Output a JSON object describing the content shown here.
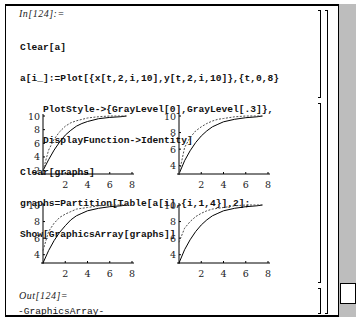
{
  "notebook": {
    "input_label": "In[124]:=",
    "input_code": [
      "Clear[a]",
      "a[i_]:=Plot[{x[t,2,i,10],y[t,2,i,10]},{t,0,8}",
      "    PlotStyle->{GrayLevel[0],GrayLevel[.3]},",
      "    DisplayFunction->Identity]",
      "Clear[graphs]",
      "graphs=Partition[Table[a[i],{i,1,4}],2];",
      "Show[GraphicsArray[graphs]]"
    ],
    "output_label": "Out[124]=",
    "output_text": "-GraphicsArray-"
  },
  "colors": {
    "background": "#ffffff",
    "text": "#111111",
    "scrollbar": "#bdbdbd",
    "solid_curve": "#000000",
    "dashed_curve": "#4d4d4d"
  },
  "chart_data": [
    {
      "type": "line",
      "title": "a[1]",
      "xlabel": "",
      "ylabel": "",
      "xticks": [
        2,
        4,
        6,
        8
      ],
      "yticks": [
        2,
        4,
        6,
        8,
        10
      ],
      "xlim": [
        0,
        8
      ],
      "ylim": [
        1.5,
        10
      ],
      "x": [
        0,
        0.5,
        1,
        1.5,
        2,
        2.5,
        3,
        3.5,
        4,
        5,
        6,
        7,
        7.5
      ],
      "series": [
        {
          "name": "x[t,2,1,10]",
          "style": "solid",
          "values": [
            2,
            3.6,
            5.0,
            6.2,
            7.2,
            7.9,
            8.5,
            8.9,
            9.2,
            9.6,
            9.8,
            9.9,
            10
          ]
        },
        {
          "name": "y[t,2,1,10]",
          "style": "dashed",
          "values": [
            2,
            5.0,
            6.6,
            7.7,
            8.5,
            9.0,
            9.3,
            9.5,
            9.7,
            9.9,
            10,
            10,
            10
          ]
        }
      ]
    },
    {
      "type": "line",
      "title": "a[2]",
      "xlabel": "",
      "ylabel": "",
      "xticks": [
        2,
        4,
        6,
        8
      ],
      "yticks": [
        4,
        6,
        8,
        10
      ],
      "xlim": [
        0,
        8
      ],
      "ylim": [
        3,
        10
      ],
      "x": [
        0,
        0.5,
        1,
        1.5,
        2,
        2.5,
        3,
        3.5,
        4,
        5,
        6,
        7,
        7.5
      ],
      "series": [
        {
          "name": "x[t,2,2,10]",
          "style": "solid",
          "values": [
            3,
            4.6,
            5.8,
            6.8,
            7.6,
            8.2,
            8.7,
            9.0,
            9.3,
            9.6,
            9.8,
            9.9,
            10
          ]
        },
        {
          "name": "y[t,2,2,10]",
          "style": "dashed",
          "values": [
            3,
            6.2,
            7.4,
            8.2,
            8.7,
            9.1,
            9.4,
            9.6,
            9.7,
            9.9,
            10,
            10,
            10
          ]
        }
      ]
    },
    {
      "type": "line",
      "title": "a[3]",
      "xlabel": "",
      "ylabel": "",
      "xticks": [
        2,
        4,
        6,
        8
      ],
      "yticks": [
        4,
        6,
        8,
        10
      ],
      "xlim": [
        0,
        8
      ],
      "ylim": [
        3,
        10
      ],
      "x": [
        0,
        0.5,
        1,
        1.5,
        2,
        2.5,
        3,
        3.5,
        4,
        5,
        6,
        7,
        7.5
      ],
      "series": [
        {
          "name": "x[t,2,3,10]",
          "style": "solid",
          "values": [
            3,
            4.5,
            5.7,
            6.7,
            7.5,
            8.2,
            8.7,
            9.0,
            9.3,
            9.6,
            9.8,
            9.9,
            10
          ]
        },
        {
          "name": "y[t,2,3,10]",
          "style": "dashed",
          "values": [
            4.5,
            6.8,
            7.8,
            8.5,
            8.9,
            9.2,
            9.5,
            9.6,
            9.7,
            9.9,
            10,
            10,
            10
          ]
        }
      ]
    },
    {
      "type": "line",
      "title": "a[4]",
      "xlabel": "",
      "ylabel": "",
      "xticks": [
        2,
        4,
        6,
        8
      ],
      "yticks": [
        4,
        6,
        8,
        10
      ],
      "xlim": [
        0,
        8
      ],
      "ylim": [
        3,
        10
      ],
      "x": [
        0,
        0.5,
        1,
        1.5,
        2,
        2.5,
        3,
        3.5,
        4,
        5,
        6,
        7,
        7.5
      ],
      "series": [
        {
          "name": "x[t,2,4,10]",
          "style": "solid",
          "values": [
            3,
            4.6,
            5.8,
            6.8,
            7.6,
            8.2,
            8.7,
            9.0,
            9.3,
            9.6,
            9.8,
            9.9,
            10
          ]
        },
        {
          "name": "y[t,2,4,10]",
          "style": "dashed",
          "values": [
            5.5,
            7.2,
            8.0,
            8.6,
            9.0,
            9.3,
            9.5,
            9.6,
            9.7,
            9.9,
            10,
            10,
            10
          ]
        }
      ]
    }
  ]
}
